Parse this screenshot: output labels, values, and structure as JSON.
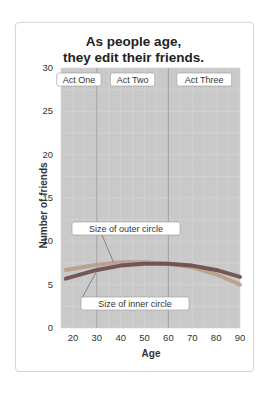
{
  "chart_data": {
    "type": "line",
    "title": "As people age, they edit their friends.",
    "title_lines": [
      "As people age,",
      "they edit their friends."
    ],
    "xlabel": "Age",
    "ylabel": "Number of friends",
    "xlim": [
      15,
      90
    ],
    "ylim": [
      0,
      30
    ],
    "x_ticks": [
      20,
      30,
      40,
      50,
      60,
      70,
      80,
      90
    ],
    "y_ticks": [
      0,
      5,
      10,
      15,
      20,
      25,
      30
    ],
    "grid": true,
    "regions": [
      {
        "label": "Act One",
        "from": 15,
        "to": 30
      },
      {
        "label": "Act Two",
        "from": 30,
        "to": 60
      },
      {
        "label": "Act Three",
        "from": 60,
        "to": 90
      }
    ],
    "series": [
      {
        "name": "Size of outer circle",
        "color": "#b89a86",
        "x": [
          17,
          30,
          40,
          50,
          60,
          70,
          80,
          90
        ],
        "values": [
          6.7,
          7.3,
          7.6,
          7.6,
          7.4,
          7.0,
          6.2,
          5.0
        ]
      },
      {
        "name": "Size of inner circle",
        "color": "#6a4a4a",
        "x": [
          17,
          30,
          40,
          50,
          60,
          70,
          80,
          90
        ],
        "values": [
          5.7,
          6.7,
          7.2,
          7.4,
          7.4,
          7.2,
          6.7,
          5.9
        ]
      }
    ],
    "annotations": [
      {
        "text": "Size of outer circle",
        "points_to": {
          "x": 37,
          "y": 7.6
        }
      },
      {
        "text": "Size of inner circle",
        "points_to": {
          "x": 30,
          "y": 6.6
        }
      }
    ]
  }
}
